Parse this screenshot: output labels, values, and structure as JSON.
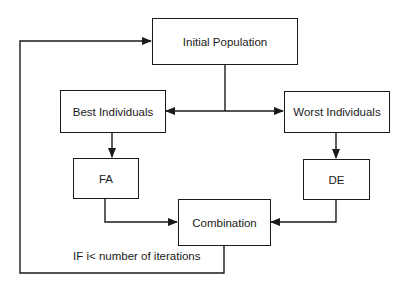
{
  "diagram": {
    "type": "flowchart",
    "nodes": {
      "initial_population": "Initial Population",
      "best_individuals": "Best Individuals",
      "worst_individuals": "Worst Individuals",
      "fa": "FA",
      "de": "DE",
      "combination": "Combination"
    },
    "loop_label": "IF i< number of iterations",
    "edges": [
      {
        "from": "Initial Population",
        "to": "Best Individuals"
      },
      {
        "from": "Initial Population",
        "to": "Worst Individuals"
      },
      {
        "from": "Best Individuals",
        "to": "FA"
      },
      {
        "from": "Worst Individuals",
        "to": "DE"
      },
      {
        "from": "FA",
        "to": "Combination"
      },
      {
        "from": "DE",
        "to": "Combination"
      },
      {
        "from": "Combination",
        "to": "Initial Population",
        "label": "IF i< number of iterations"
      }
    ],
    "colors": {
      "line": "#1a1a1a",
      "background": "#ffffff"
    }
  }
}
